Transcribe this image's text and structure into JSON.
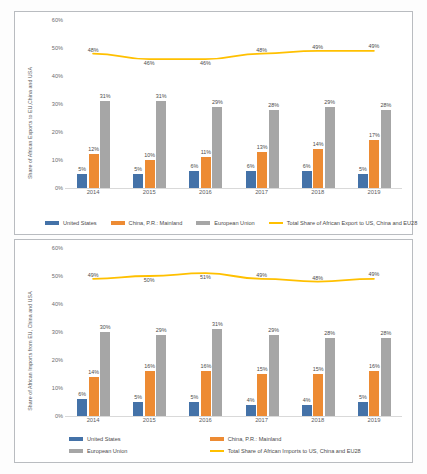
{
  "chart_data": [
    {
      "id": "exports",
      "type": "bar",
      "title": "",
      "xlabel": "",
      "ylabel": "Share of African Exports to EU,China and USA",
      "ylim": [
        0,
        60
      ],
      "yticks": [
        "0%",
        "10%",
        "20%",
        "30%",
        "40%",
        "50%",
        "60%"
      ],
      "grid": false,
      "legend_position": "bottom",
      "categories": [
        "2014",
        "2015",
        "2016",
        "2017",
        "2018",
        "2019"
      ],
      "series": [
        {
          "name": "United States",
          "kind": "bar",
          "color": "#4472a8",
          "values": [
            5,
            5,
            6,
            6,
            6,
            5
          ],
          "labels": [
            "5%",
            "5%",
            "6%",
            "6%",
            "6%",
            "5%"
          ]
        },
        {
          "name": "China, P.R.: Mainland",
          "kind": "bar",
          "color": "#ed8b33",
          "values": [
            12,
            10,
            11,
            13,
            14,
            17
          ],
          "labels": [
            "12%",
            "10%",
            "11%",
            "13%",
            "14%",
            "17%"
          ]
        },
        {
          "name": "European Union",
          "kind": "bar",
          "color": "#a6a6a6",
          "values": [
            31,
            31,
            29,
            28,
            29,
            28
          ],
          "labels": [
            "31%",
            "31%",
            "29%",
            "28%",
            "29%",
            "28%"
          ]
        },
        {
          "name": "Total Share of African Export to US, China and EU28",
          "kind": "line",
          "color": "#ffc000",
          "values": [
            48,
            46,
            46,
            48,
            49,
            49
          ],
          "labels": [
            "48%",
            "46%",
            "46%",
            "48%",
            "49%",
            "49%"
          ]
        }
      ]
    },
    {
      "id": "imports",
      "type": "bar",
      "title": "",
      "xlabel": "",
      "ylabel": "Share of African Imports from EU, China and USA",
      "ylim": [
        0,
        60
      ],
      "yticks": [
        "0%",
        "10%",
        "20%",
        "30%",
        "40%",
        "50%",
        "60%"
      ],
      "grid": false,
      "legend_position": "bottom",
      "categories": [
        "2014",
        "2015",
        "2016",
        "2017",
        "2018",
        "2019"
      ],
      "series": [
        {
          "name": "United States",
          "kind": "bar",
          "color": "#4472a8",
          "values": [
            6,
            5,
            5,
            4,
            4,
            5
          ],
          "labels": [
            "6%",
            "5%",
            "5%",
            "4%",
            "4%",
            "5%"
          ]
        },
        {
          "name": "China, P.R.: Mainland",
          "kind": "bar",
          "color": "#ed8b33",
          "values": [
            14,
            16,
            16,
            15,
            15,
            16
          ],
          "labels": [
            "14%",
            "16%",
            "16%",
            "15%",
            "15%",
            "16%"
          ]
        },
        {
          "name": "European Union",
          "kind": "bar",
          "color": "#a6a6a6",
          "values": [
            30,
            29,
            31,
            29,
            28,
            28
          ],
          "labels": [
            "30%",
            "29%",
            "31%",
            "29%",
            "28%",
            "28%"
          ]
        },
        {
          "name": "Total Share of African Imports to US, China and EU28",
          "kind": "line",
          "color": "#ffc000",
          "values": [
            49,
            50,
            51,
            49,
            48,
            49
          ],
          "labels": [
            "49%",
            "50%",
            "51%",
            "49%",
            "48%",
            "49%"
          ]
        }
      ]
    }
  ]
}
